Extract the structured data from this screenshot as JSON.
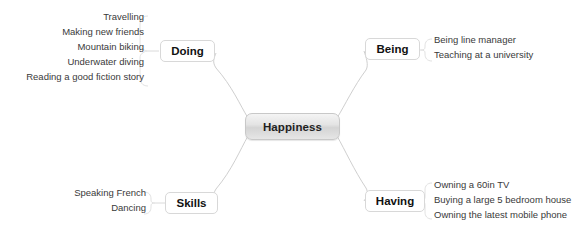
{
  "canvas": {
    "width": 588,
    "height": 231,
    "background": "#ffffff"
  },
  "diagram": {
    "type": "mind-map",
    "center": {
      "label": "Happiness",
      "x": 245,
      "y": 113,
      "width": 95,
      "height": 27,
      "fill_top": "#f4f4f4",
      "fill_bottom": "#d4d4d4",
      "border_color": "#c8c8c8",
      "text_color": "#1f1f1f"
    },
    "branch_style": {
      "fill": "#ffffff",
      "border_color": "#d8d8d8",
      "text_color": "#111111"
    },
    "connector_style": {
      "stroke": "#cfcfcf",
      "stroke_light": "#e2e2e2",
      "width": 1
    },
    "branches": [
      {
        "id": "doing",
        "label": "Doing",
        "position": "top-left",
        "node": {
          "x": 160,
          "y": 40,
          "width": 55,
          "height": 22
        },
        "leaf_align": "right",
        "leaves_box": {
          "right": 444,
          "top": 9
        },
        "leaves": [
          "Travelling",
          "Making new friends",
          "Mountain biking",
          "Underwater diving",
          "Reading a good fiction story"
        ]
      },
      {
        "id": "being",
        "label": "Being",
        "position": "top-right",
        "node": {
          "x": 365,
          "y": 38,
          "width": 55,
          "height": 22
        },
        "leaf_align": "left",
        "leaves_box": {
          "left": 434,
          "top": 32
        },
        "leaves": [
          "Being line manager",
          "Teaching at a university"
        ]
      },
      {
        "id": "skills",
        "label": "Skills",
        "position": "bottom-left",
        "node": {
          "x": 165,
          "y": 192,
          "width": 53,
          "height": 22
        },
        "leaf_align": "right",
        "leaves_box": {
          "right": 442,
          "top": 185
        },
        "leaves": [
          "Speaking French",
          "Dancing"
        ]
      },
      {
        "id": "having",
        "label": "Having",
        "position": "bottom-right",
        "node": {
          "x": 365,
          "y": 190,
          "width": 60,
          "height": 22
        },
        "leaf_align": "left",
        "leaves_box": {
          "left": 434,
          "top": 177
        },
        "leaves": [
          "Owning a 60in TV",
          "Buying a large 5 bedroom house",
          "Owning the latest mobile phone"
        ]
      }
    ]
  }
}
